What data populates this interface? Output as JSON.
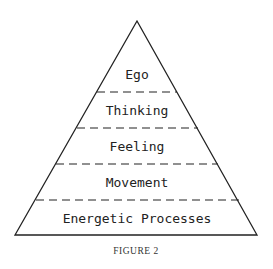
{
  "figure": {
    "caption": "FIGURE 2",
    "type": "pyramid",
    "levels": [
      {
        "label": "Ego"
      },
      {
        "label": "Thinking"
      },
      {
        "label": "Feeling"
      },
      {
        "label": "Movement"
      },
      {
        "label": "Energetic Processes"
      }
    ],
    "line_color": "#222222",
    "divider_style": "dashed"
  }
}
